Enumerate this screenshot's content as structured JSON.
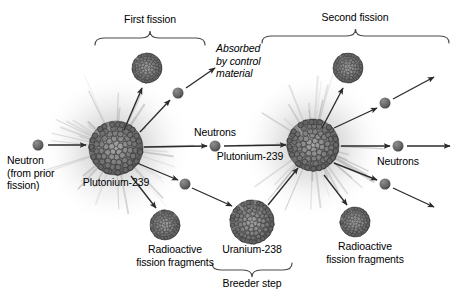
{
  "diagram": {
    "background_color": "#ffffff",
    "text_color": "#000000",
    "nucleus_color": "#6b6b6b",
    "neutron_color": "#5a5a5a",
    "arrow_color": "#2b2b2b",
    "bracket_color": "#4a4a4a",
    "glow_color": "#c9c9c9"
  },
  "brackets": [
    {
      "id": "first-fission",
      "label": "First fission",
      "x1": 95,
      "x2": 205,
      "y": 38,
      "label_x": 150,
      "label_y": 13
    },
    {
      "id": "second-fission",
      "label": "Second fission",
      "x1": 262,
      "x2": 449,
      "y": 36,
      "label_x": 355,
      "label_y": 11
    },
    {
      "id": "breeder-step",
      "label": "Breeder step",
      "x1": 212,
      "x2": 292,
      "y": 270,
      "label_x": 252,
      "label_y": 277
    }
  ],
  "labels": {
    "incoming_neutron": "Neutron\n(from prior\nfission)",
    "plutonium_left": "Plutonium-239",
    "plutonium_right": "Plutonium-239",
    "uranium": "Uranium-238",
    "absorbed": "Absorbed\nby control\nmaterial",
    "neutrons_middle": "Neutrons",
    "neutrons_right": "Neutrons",
    "fragments_left": "Radioactive\nfission fragments",
    "fragments_right": "Radioactive\nfission fragments"
  },
  "nuclei": [
    {
      "id": "plutonium-239-left",
      "name": "Plutonium-239",
      "cx": 116,
      "cy": 148,
      "r": 27,
      "glow": true
    },
    {
      "id": "fission-fragment-upper-left",
      "name": "Radioactive fission fragment",
      "cx": 147,
      "cy": 68,
      "r": 15,
      "glow": false
    },
    {
      "id": "fission-fragment-lower-left",
      "name": "Radioactive fission fragment",
      "cx": 165,
      "cy": 225,
      "r": 15,
      "glow": false
    },
    {
      "id": "uranium-238",
      "name": "Uranium-238",
      "cx": 252,
      "cy": 222,
      "r": 22,
      "glow": false
    },
    {
      "id": "plutonium-239-right",
      "name": "Plutonium-239",
      "cx": 313,
      "cy": 145,
      "r": 26,
      "glow": true
    },
    {
      "id": "fission-fragment-upper-right",
      "name": "Radioactive fission fragment",
      "cx": 348,
      "cy": 68,
      "r": 15,
      "glow": false
    },
    {
      "id": "fission-fragment-lower-right",
      "name": "Radioactive fission fragment",
      "cx": 355,
      "cy": 222,
      "r": 15,
      "glow": false
    }
  ],
  "neutrons": [
    {
      "id": "neutron-incoming",
      "cx": 38,
      "cy": 145,
      "r": 5.5
    },
    {
      "id": "neutron-absorbed",
      "cx": 178,
      "cy": 93,
      "r": 5.5
    },
    {
      "id": "neutron-to-second-fission",
      "cx": 215,
      "cy": 146,
      "r": 5.5
    },
    {
      "id": "neutron-to-uranium",
      "cx": 185,
      "cy": 184,
      "r": 5.5
    },
    {
      "id": "neutron-escaping-upper",
      "cx": 385,
      "cy": 103,
      "r": 5.5
    },
    {
      "id": "neutron-escaping-middle",
      "cx": 398,
      "cy": 146,
      "r": 5.5
    },
    {
      "id": "neutron-escaping-lower",
      "cx": 385,
      "cy": 184,
      "r": 5.5
    }
  ],
  "arrows": [
    {
      "id": "arrow-incoming-neutron",
      "x1": 48,
      "y1": 145,
      "x2": 86,
      "y2": 145
    },
    {
      "id": "arrow-fragment-upper-left",
      "x1": 124,
      "y1": 130,
      "x2": 142,
      "y2": 88
    },
    {
      "id": "arrow-neutron-absorbed-in",
      "x1": 140,
      "y1": 132,
      "x2": 170,
      "y2": 100
    },
    {
      "id": "arrow-neutron-absorbed-out",
      "x1": 186,
      "y1": 88,
      "x2": 215,
      "y2": 68
    },
    {
      "id": "arrow-neutron-middle-in",
      "x1": 144,
      "y1": 147,
      "x2": 207,
      "y2": 146
    },
    {
      "id": "arrow-neutron-middle-out",
      "x1": 224,
      "y1": 146,
      "x2": 286,
      "y2": 145
    },
    {
      "id": "arrow-neutron-uranium-in",
      "x1": 137,
      "y1": 163,
      "x2": 178,
      "y2": 180
    },
    {
      "id": "arrow-neutron-uranium-out",
      "x1": 192,
      "y1": 188,
      "x2": 232,
      "y2": 206
    },
    {
      "id": "arrow-fragment-lower-left",
      "x1": 131,
      "y1": 176,
      "x2": 156,
      "y2": 208
    },
    {
      "id": "arrow-breeder-to-plutonium",
      "x1": 268,
      "y1": 205,
      "x2": 298,
      "y2": 168
    },
    {
      "id": "arrow-fragment-upper-right",
      "x1": 322,
      "y1": 128,
      "x2": 343,
      "y2": 88
    },
    {
      "id": "arrow-neutron-upper-right-in",
      "x1": 334,
      "y1": 128,
      "x2": 377,
      "y2": 108
    },
    {
      "id": "arrow-neutron-upper-right-out",
      "x1": 393,
      "y1": 99,
      "x2": 434,
      "y2": 77
    },
    {
      "id": "arrow-neutron-middle-right-in",
      "x1": 341,
      "y1": 146,
      "x2": 390,
      "y2": 146
    },
    {
      "id": "arrow-neutron-middle-right-out",
      "x1": 407,
      "y1": 146,
      "x2": 450,
      "y2": 146
    },
    {
      "id": "arrow-neutron-lower-right-in",
      "x1": 334,
      "y1": 163,
      "x2": 377,
      "y2": 180
    },
    {
      "id": "arrow-neutron-lower-right-out",
      "x1": 393,
      "y1": 188,
      "x2": 434,
      "y2": 207
    },
    {
      "id": "arrow-fragment-lower-right",
      "x1": 324,
      "y1": 175,
      "x2": 347,
      "y2": 205
    }
  ],
  "label_positions": {
    "incoming_neutron": {
      "x": 7,
      "y": 154
    },
    "plutonium_left": {
      "x": 116,
      "y": 176
    },
    "plutonium_right": {
      "x": 250,
      "y": 150
    },
    "uranium": {
      "x": 252,
      "y": 243
    },
    "absorbed": {
      "x": 216,
      "y": 42
    },
    "neutrons_middle": {
      "x": 215,
      "y": 126
    },
    "neutrons_right": {
      "x": 398,
      "y": 155
    },
    "fragments_left": {
      "x": 175,
      "y": 243
    },
    "fragments_right": {
      "x": 365,
      "y": 240
    }
  }
}
